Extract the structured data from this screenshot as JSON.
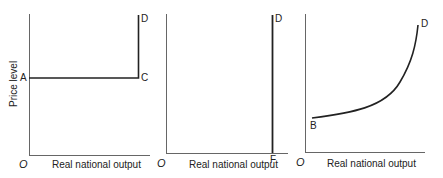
{
  "panels": [
    {
      "id": "panel-1",
      "ylabel": "Price level",
      "xlabel": "Real national output",
      "origin": "O",
      "points": {
        "A": "A",
        "C": "C",
        "D": "D"
      },
      "curve": "horizontal from A to C then vertical from C to D"
    },
    {
      "id": "panel-2",
      "xlabel": "Real national output",
      "origin": "O",
      "points": {
        "F": "F",
        "D": "D"
      },
      "curve": "vertical line at F up to D"
    },
    {
      "id": "panel-3",
      "xlabel": "Real national output",
      "origin": "O",
      "points": {
        "B": "B",
        "D": "D"
      },
      "curve": "upward-sloping convex curve from B to D"
    }
  ],
  "colors": {
    "axis": "#555555",
    "curve": "#222222",
    "text": "#222222"
  }
}
